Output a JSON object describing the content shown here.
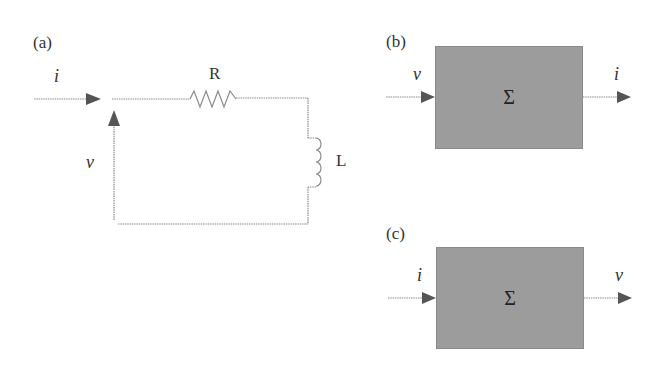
{
  "panels": {
    "a": {
      "label": "(a)",
      "current_label": "i",
      "voltage_label": "v",
      "resistor_label": "R",
      "inductor_label": "L"
    },
    "b": {
      "label": "(b)",
      "input_label": "v",
      "output_label": "i",
      "block_symbol": "Σ"
    },
    "c": {
      "label": "(c)",
      "input_label": "i",
      "output_label": "v",
      "block_symbol": "Σ"
    }
  },
  "colors": {
    "wire": "#8c8c8c",
    "arrow": "#555555",
    "block_fill": "#9c9c9c"
  }
}
